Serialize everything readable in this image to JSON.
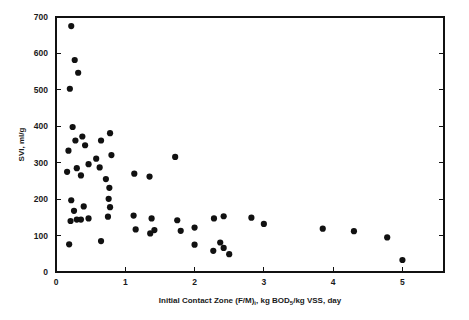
{
  "chart_data": {
    "type": "scatter",
    "title": "",
    "xlabel": "Initial Contact Zone (F/M)i, kg BOD5/kg VSS, day",
    "xlabel_parts": {
      "before_sub1": "Initial Contact Zone (F/M)",
      "sub1": "i",
      "between": ", kg BOD",
      "sub2": "5",
      "after": "/kg VSS, day"
    },
    "ylabel": "SVI, ml/g",
    "xlim": [
      0,
      5.6
    ],
    "ylim": [
      0,
      700
    ],
    "xticks": [
      0,
      1,
      2,
      3,
      4,
      5
    ],
    "xtick_labels": [
      "0",
      "1",
      "2",
      "3",
      "4",
      "5"
    ],
    "yticks": [
      0,
      100,
      200,
      300,
      400,
      500,
      600,
      700
    ],
    "ytick_labels": [
      "0",
      "100",
      "200",
      "300",
      "400",
      "500",
      "600",
      "700"
    ],
    "grid": false,
    "legend": false,
    "marker": "filled-circle",
    "marker_color": "#111111",
    "marker_size_px": 5,
    "series": [
      {
        "name": "SVI vs Initial Contact Zone F/M",
        "points": [
          [
            0.22,
            675
          ],
          [
            0.27,
            582
          ],
          [
            0.32,
            547
          ],
          [
            0.2,
            503
          ],
          [
            0.24,
            398
          ],
          [
            0.38,
            372
          ],
          [
            0.78,
            381
          ],
          [
            0.28,
            361
          ],
          [
            0.42,
            348
          ],
          [
            0.65,
            361
          ],
          [
            0.18,
            333
          ],
          [
            0.58,
            311
          ],
          [
            0.47,
            296
          ],
          [
            0.8,
            321
          ],
          [
            0.63,
            287
          ],
          [
            0.3,
            285
          ],
          [
            0.16,
            275
          ],
          [
            1.72,
            316
          ],
          [
            0.36,
            265
          ],
          [
            0.72,
            255
          ],
          [
            1.13,
            270
          ],
          [
            1.35,
            262
          ],
          [
            0.77,
            231
          ],
          [
            0.22,
            197
          ],
          [
            0.76,
            201
          ],
          [
            0.4,
            180
          ],
          [
            0.78,
            178
          ],
          [
            0.26,
            168
          ],
          [
            0.75,
            152
          ],
          [
            0.21,
            140
          ],
          [
            0.3,
            144
          ],
          [
            0.36,
            144
          ],
          [
            0.47,
            147
          ],
          [
            1.12,
            155
          ],
          [
            1.38,
            147
          ],
          [
            1.75,
            142
          ],
          [
            2.28,
            147
          ],
          [
            2.42,
            153
          ],
          [
            2.82,
            149
          ],
          [
            3.0,
            132
          ],
          [
            2.0,
            122
          ],
          [
            1.15,
            117
          ],
          [
            1.42,
            115
          ],
          [
            1.36,
            106
          ],
          [
            1.8,
            113
          ],
          [
            3.85,
            119
          ],
          [
            4.3,
            112
          ],
          [
            4.78,
            95
          ],
          [
            0.65,
            85
          ],
          [
            0.19,
            76
          ],
          [
            2.0,
            75
          ],
          [
            2.37,
            81
          ],
          [
            2.42,
            66
          ],
          [
            2.27,
            58
          ],
          [
            2.5,
            49
          ],
          [
            5.0,
            33
          ]
        ]
      }
    ],
    "n_points": 56
  },
  "figure": {
    "background": "#ffffff",
    "foreground": "#111111"
  }
}
